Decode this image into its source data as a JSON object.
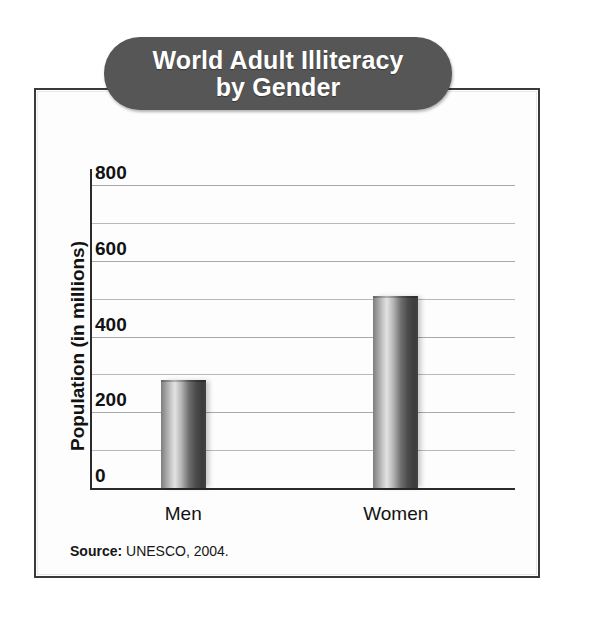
{
  "figure": {
    "title_line1": "World Adult Illiteracy",
    "title_line2": "by Gender",
    "title_banner_color": "#565656",
    "title_text_color": "#ffffff",
    "frame_border_color": "#3a3a3a",
    "background_color": "#ffffff",
    "source_label": "Source:",
    "source_text": " UNESCO, 2004."
  },
  "chart_data": {
    "type": "bar",
    "title": "World Adult Illiteracy by Gender",
    "categories": [
      "Men",
      "Women"
    ],
    "values": [
      285,
      507
    ],
    "xlabel": "",
    "ylabel": "Population (in millions)",
    "ylim": [
      0,
      800
    ],
    "ytick_labels": [
      "0",
      "200",
      "400",
      "600",
      "800"
    ],
    "ytick_values": [
      0,
      200,
      400,
      600,
      800
    ],
    "gridline_values": [
      100,
      200,
      300,
      400,
      500,
      600,
      700,
      800
    ],
    "grid": true,
    "legend": "none",
    "bar_color": "#6e6e6e",
    "source": "Source: UNESCO, 2004."
  }
}
